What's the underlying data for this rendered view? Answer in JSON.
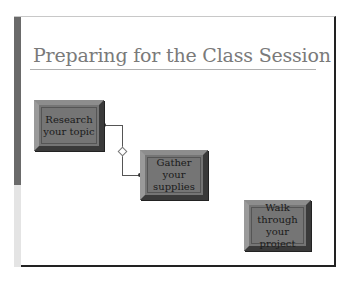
{
  "slide": {
    "title": "Preparing for the Class Session",
    "steps": [
      {
        "label_line1": "Research",
        "label_line2": "your topic"
      },
      {
        "label_line1": "Gather your",
        "label_line2": "supplies"
      },
      {
        "label_line1": "Walk",
        "label_line2": "through",
        "label_line3": "your project"
      }
    ]
  },
  "colors": {
    "title": "#7a7a7a",
    "box_fill": "#757575",
    "left_bar_dark": "#6a6a6a",
    "left_bar_light": "#e4e4e4"
  }
}
